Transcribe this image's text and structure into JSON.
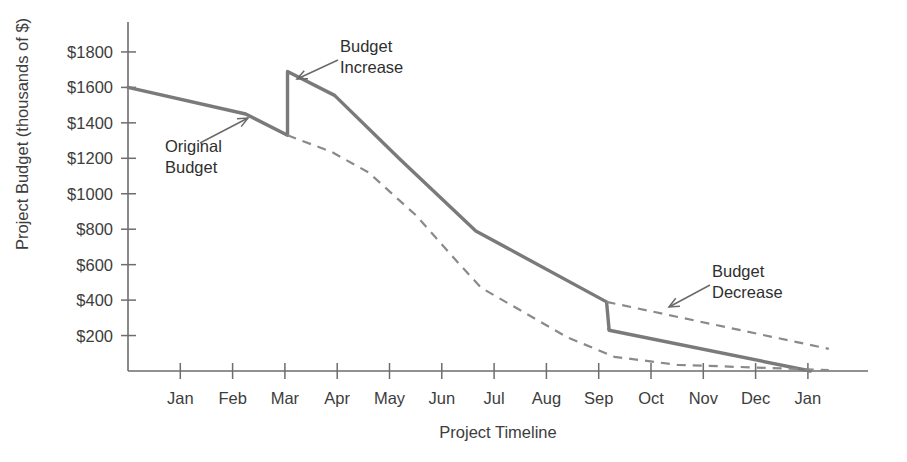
{
  "chart_data": {
    "type": "line",
    "title": "",
    "xlabel": "Project Timeline",
    "ylabel": "Project Budget (thousands of $)",
    "xtick_labels": [
      "Jan",
      "Feb",
      "Mar",
      "Apr",
      "May",
      "Jun",
      "Jul",
      "Aug",
      "Sep",
      "Oct",
      "Nov",
      "Dec",
      "Jan"
    ],
    "ytick_labels": [
      "$1800",
      "$1600",
      "$1400",
      "$1200",
      "$1000",
      "$800",
      "$600",
      "$400",
      "$200"
    ],
    "ytick_values": [
      1800,
      1600,
      1400,
      1200,
      1000,
      800,
      600,
      400,
      200
    ],
    "ylim": [
      0,
      1900
    ],
    "xlim": [
      0,
      13.4
    ],
    "grid": false,
    "legend": false,
    "series": [
      {
        "name": "Revised Budget",
        "style": "solid",
        "color": "#7a7a7a",
        "points": [
          {
            "x": 0.0,
            "y": 1600
          },
          {
            "x": 2.25,
            "y": 1450
          },
          {
            "x": 3.05,
            "y": 1330
          },
          {
            "x": 3.05,
            "y": 1690
          },
          {
            "x": 3.95,
            "y": 1555
          },
          {
            "x": 5.2,
            "y": 1195
          },
          {
            "x": 6.65,
            "y": 790
          },
          {
            "x": 9.15,
            "y": 390
          },
          {
            "x": 9.2,
            "y": 230
          },
          {
            "x": 13.05,
            "y": 0
          }
        ]
      },
      {
        "name": "Original Budget",
        "style": "dashed",
        "color": "#8a8a8a",
        "points": [
          {
            "x": 3.05,
            "y": 1330
          },
          {
            "x": 3.9,
            "y": 1235
          },
          {
            "x": 4.6,
            "y": 1120
          },
          {
            "x": 5.5,
            "y": 880
          },
          {
            "x": 6.3,
            "y": 615
          },
          {
            "x": 6.75,
            "y": 470
          },
          {
            "x": 8.4,
            "y": 190
          },
          {
            "x": 9.3,
            "y": 80
          },
          {
            "x": 10.5,
            "y": 35
          },
          {
            "x": 13.4,
            "y": 5
          }
        ]
      },
      {
        "name": "Original Budget Tail",
        "style": "dashed",
        "color": "#8a8a8a",
        "points": [
          {
            "x": 9.15,
            "y": 390
          },
          {
            "x": 13.4,
            "y": 125
          }
        ]
      }
    ],
    "annotations": [
      {
        "id": "original-budget",
        "text_lines": [
          "Original",
          "Budget"
        ],
        "text_x": 165,
        "text_y": 152,
        "leader": {
          "x1": 200,
          "y1": 143,
          "x2": 248,
          "y2": 118
        },
        "arrow": "up-right"
      },
      {
        "id": "budget-increase",
        "text_lines": [
          "Budget",
          "Increase"
        ],
        "text_x": 340,
        "text_y": 52,
        "leader": {
          "x1": 338,
          "y1": 60,
          "x2": 297,
          "y2": 79
        },
        "arrow": "down-left"
      },
      {
        "id": "budget-decrease",
        "text_lines": [
          "Budget",
          "Decrease"
        ],
        "text_x": 712,
        "text_y": 277,
        "leader": {
          "x1": 710,
          "y1": 285,
          "x2": 669,
          "y2": 307
        },
        "arrow": "down-left"
      }
    ],
    "vertical_connectors": [
      {
        "id": "increase-connector",
        "x": 3.05,
        "y_from": 1330,
        "y_to": 1690
      },
      {
        "id": "decrease-connector",
        "x": 9.17,
        "y_from": 230,
        "y_to": 390
      }
    ]
  },
  "colors": {
    "solid_series": "#7a7a7a",
    "dashed_series": "#8a8a8a",
    "axis": "#6d6d6d",
    "text": "#3d3d3d",
    "background": "#ffffff"
  }
}
